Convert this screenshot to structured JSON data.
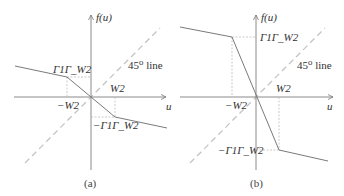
{
  "panels": [
    {
      "id": "a",
      "caption": "(a)",
      "y_axis_label": "f(u)",
      "x_axis_label": "u",
      "line_label": "45⁰ line",
      "pos_x_tick": "W2",
      "neg_x_tick": "−W2",
      "pos_y_tick": "Γ1Γ_W2",
      "neg_y_tick": "−Γ1Γ_W2"
    },
    {
      "id": "b",
      "caption": "(b)",
      "y_axis_label": "f(u)",
      "x_axis_label": "u",
      "line_label": "45⁰ line",
      "pos_x_tick": "W2",
      "neg_x_tick": "−W2",
      "pos_y_tick": "Γ1Γ_W2",
      "neg_y_tick": "−Γ1Γ_W2"
    }
  ],
  "colors": {
    "axis": "#8a8a8a",
    "curve": "#7a7a7a",
    "dashed": "#c0c0c0",
    "guide": "#bdbdbd"
  }
}
